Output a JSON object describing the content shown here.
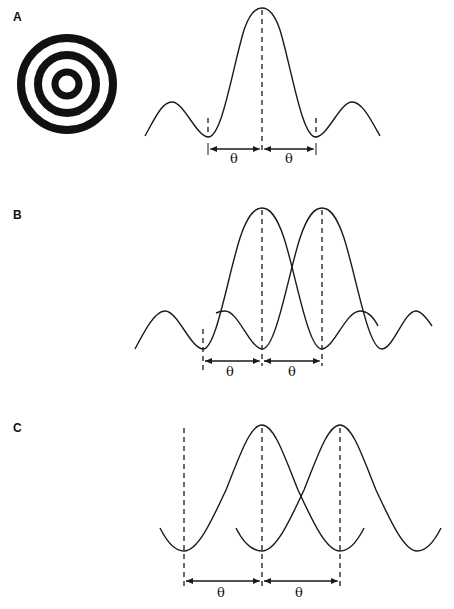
{
  "figure": {
    "panels": [
      {
        "label": "A",
        "description": "Airy disk pattern (concentric rings) and its single-source intensity profile",
        "angle_labels": [
          "θ",
          "θ"
        ]
      },
      {
        "label": "B",
        "description": "Two overlapping Airy profiles separated by angle θ (Rayleigh criterion)",
        "angle_labels": [
          "θ",
          "θ"
        ]
      },
      {
        "label": "C",
        "description": "Two overlapping cosine-like profiles separated by angle θ",
        "angle_labels": [
          "θ",
          "θ"
        ]
      }
    ],
    "colors": {
      "stroke": "#1a1a1a",
      "background": "#ffffff"
    }
  }
}
